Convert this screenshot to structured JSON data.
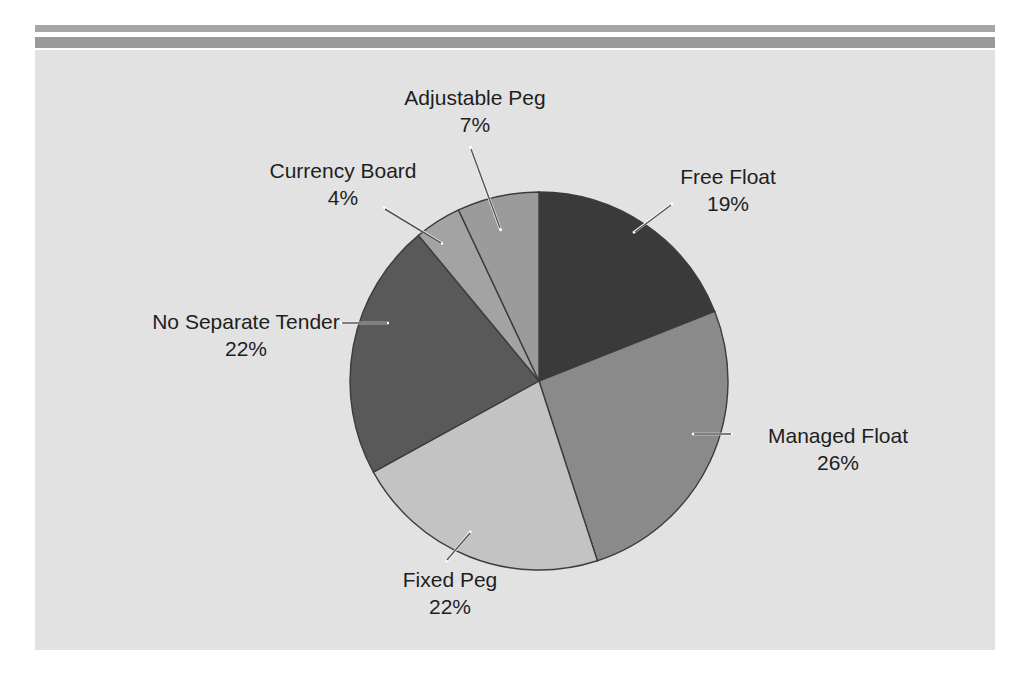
{
  "figure": {
    "background_color": "#e2e2e2",
    "page_color": "#ffffff",
    "rule_color_thin": "#a6a6a6",
    "rule_color_thick": "#9a9a9a"
  },
  "chart_data": {
    "type": "pie",
    "title": "",
    "subtitle": "",
    "xlabel": "",
    "ylabel": "",
    "legend_position": "none",
    "grid": false,
    "labels_show_percent": true,
    "start_angle_deg": 0,
    "direction": "clockwise",
    "categories": [
      "Free Float",
      "Managed Float",
      "Fixed Peg",
      "No Separate Tender",
      "Currency Board",
      "Adjustable Peg"
    ],
    "values": [
      19,
      26,
      22,
      22,
      4,
      7
    ],
    "value_unit": "%",
    "colors": [
      "#3a3a3a",
      "#8a8a8a",
      "#c3c3c3",
      "#595959",
      "#a3a3a3",
      "#9b9b9b"
    ],
    "slices": [
      {
        "name": "Free Float",
        "value": 19,
        "percent_label": "19%",
        "color": "#3a3a3a",
        "start_deg": 0,
        "end_deg": 68.4
      },
      {
        "name": "Managed Float",
        "value": 26,
        "percent_label": "26%",
        "color": "#8a8a8a",
        "start_deg": 68.4,
        "end_deg": 162.0
      },
      {
        "name": "Fixed Peg",
        "value": 22,
        "percent_label": "22%",
        "color": "#c3c3c3",
        "start_deg": 162.0,
        "end_deg": 241.2
      },
      {
        "name": "No Separate Tender",
        "value": 22,
        "percent_label": "22%",
        "color": "#595959",
        "start_deg": 241.2,
        "end_deg": 320.4
      },
      {
        "name": "Currency Board",
        "value": 4,
        "percent_label": "4%",
        "color": "#a3a3a3",
        "start_deg": 320.4,
        "end_deg": 334.8
      },
      {
        "name": "Adjustable Peg",
        "value": 7,
        "percent_label": "7%",
        "color": "#9b9b9b",
        "start_deg": 334.8,
        "end_deg": 360.0
      }
    ]
  },
  "labels": {
    "free_float": {
      "name": "Free Float",
      "percent": "19%"
    },
    "managed_float": {
      "name": "Managed Float",
      "percent": "26%"
    },
    "fixed_peg": {
      "name": "Fixed Peg",
      "percent": "22%"
    },
    "no_separate_tender": {
      "name": "No Separate Tender",
      "percent": "22%"
    },
    "currency_board": {
      "name": "Currency Board",
      "percent": "4%"
    },
    "adjustable_peg": {
      "name": "Adjustable Peg",
      "percent": "7%"
    }
  }
}
